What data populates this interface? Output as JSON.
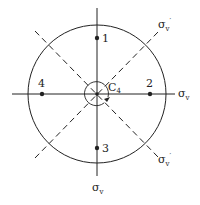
{
  "diagram": {
    "type": "symmetry-element-diagram",
    "center_label": "C",
    "center_label_sub": "4",
    "points": [
      {
        "label": "1"
      },
      {
        "label": "2"
      },
      {
        "label": "3"
      },
      {
        "label": "4"
      }
    ],
    "planes": {
      "sigma_v_right": {
        "sym": "σ",
        "sub": "v"
      },
      "sigma_v_bottom": {
        "sym": "σ",
        "sub": "v"
      },
      "sigma_vp_top_right": {
        "sym": "σ",
        "sub": "v",
        "prime": "′"
      },
      "sigma_vp_bottom_right": {
        "sym": "σ",
        "sub": "v",
        "prime": "′"
      }
    },
    "colors": {
      "line": "#222222",
      "background": "#ffffff"
    }
  }
}
